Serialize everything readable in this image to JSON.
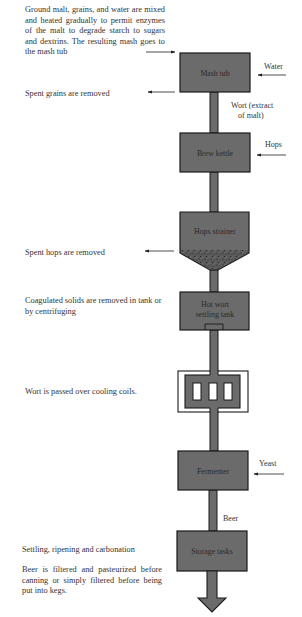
{
  "colors": {
    "vessel_fill": "#6b6b6b",
    "vessel_stroke": "#1a1a1a",
    "text": "#333333",
    "background": "#ffffff"
  },
  "annotations_left": [
    {
      "id": "mash",
      "text": "Ground malt, grains, and water are mixed and heated gradually to permit enzymes of the malt to degrade starch to sugars and dextrins. The resulting mash goes to the mash tub"
    },
    {
      "id": "spent-grains",
      "text": "Spent grains are removed"
    },
    {
      "id": "spent-hops",
      "text": "Spent hops are removed"
    },
    {
      "id": "coagulated",
      "text": "Coagulated solids are removed in tank or by centrifuging"
    },
    {
      "id": "cooling",
      "text": "Wort is passed over cooling coils."
    },
    {
      "id": "settling",
      "text": "Settling, ripening and carbonation"
    },
    {
      "id": "filtering",
      "text": "Beer is filtered and pasteurized before canning or simply filtered before being put into kegs."
    }
  ],
  "vessels": [
    {
      "id": "mash-tub",
      "label": "Mash tub"
    },
    {
      "id": "brew-kettle",
      "label": "Brew kettle"
    },
    {
      "id": "hops-strainer",
      "label": "Hops strainer"
    },
    {
      "id": "hot-wort-settling-tank",
      "label_line1": "Hot wort",
      "label_line2": "settling tank"
    },
    {
      "id": "cooling-coils",
      "label": ""
    },
    {
      "id": "fermenter",
      "label": "Fermenter"
    },
    {
      "id": "storage-tanks",
      "label": "Storage tasks"
    }
  ],
  "inputs_right": [
    {
      "id": "water",
      "label": "Water"
    },
    {
      "id": "hops",
      "label": "Hops"
    },
    {
      "id": "yeast",
      "label": "Yeast"
    }
  ],
  "flow_labels": {
    "wort_line1": "Wort (extract",
    "wort_line2": "of malt)",
    "beer": "Beer"
  }
}
